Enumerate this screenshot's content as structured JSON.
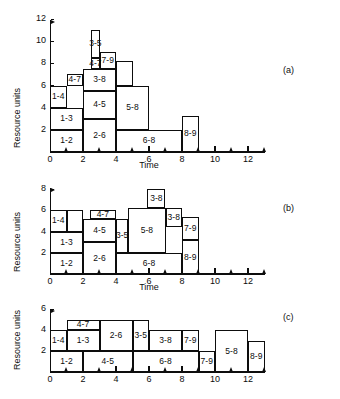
{
  "figure": {
    "caption_a": "(a)",
    "caption_b": "(b)",
    "caption_c": "(c)"
  },
  "axis_titles": {
    "y": "Resource units",
    "x": "Time"
  },
  "chart_data": [
    {
      "id": "a",
      "type": "bar",
      "title": "(a)",
      "xlabel": "Time",
      "ylabel": "Resource units",
      "xlim": [
        0,
        13
      ],
      "ylim": [
        0,
        12
      ],
      "xticks": [
        0,
        2,
        4,
        6,
        8,
        10,
        12
      ],
      "xtick_labels": [
        "0",
        "2",
        "4",
        "6",
        "8",
        "10",
        "12"
      ],
      "xminor_ticks": [
        1,
        3,
        5,
        7,
        9,
        11,
        13
      ],
      "yticks": [
        2,
        4,
        6,
        8,
        10,
        12
      ],
      "ytick_labels": [
        "2",
        "4",
        "6",
        "8",
        "10",
        "12"
      ],
      "grid": false,
      "legend": "none",
      "blocks": [
        {
          "label": "1-2",
          "x0": 0,
          "x1": 2,
          "y0": 0,
          "y1": 2
        },
        {
          "label": "1-3",
          "x0": 0,
          "x1": 2,
          "y0": 2,
          "y1": 4
        },
        {
          "label": "1-4",
          "x0": 0,
          "x1": 1,
          "y0": 4,
          "y1": 6
        },
        {
          "label": "4-7",
          "x0": 1,
          "x1": 2,
          "y0": 6,
          "y1": 7
        },
        {
          "label": "2-6",
          "x0": 2,
          "x1": 4,
          "y0": 0,
          "y1": 3
        },
        {
          "label": "4-5",
          "x0": 2,
          "x1": 4,
          "y0": 3,
          "y1": 5.5
        },
        {
          "label": "3-8",
          "x0": 2,
          "x1": 4,
          "y0": 5.5,
          "y1": 7.5
        },
        {
          "label": "4-7",
          "x0": 2.5,
          "x1": 3,
          "y0": 7.5,
          "y1": 8.5
        },
        {
          "label": "3-5",
          "x0": 2.5,
          "x1": 3,
          "y0": 8.5,
          "y1": 11
        },
        {
          "label": "7-9",
          "x0": 3,
          "x1": 4,
          "y0": 7.5,
          "y1": 9
        },
        {
          "label": "6-8",
          "x0": 4,
          "x1": 8,
          "y0": 0,
          "y1": 2
        },
        {
          "label": "5-8",
          "x0": 4,
          "x1": 6,
          "y0": 2,
          "y1": 6
        },
        {
          "label": "8-9",
          "x0": 8,
          "x1": 9,
          "y0": 0,
          "y1": 3.25
        },
        {
          "label": "",
          "x0": 4,
          "x1": 5,
          "y0": 6,
          "y1": 8.2
        }
      ]
    },
    {
      "id": "b",
      "type": "bar",
      "title": "(b)",
      "xlabel": "Time",
      "ylabel": "Resource units",
      "xlim": [
        0,
        13
      ],
      "ylim": [
        0,
        8
      ],
      "xticks": [
        0,
        2,
        4,
        6,
        8,
        10,
        12
      ],
      "xtick_labels": [
        "0",
        "2",
        "4",
        "6",
        "8",
        "10",
        "12"
      ],
      "xminor_ticks": [
        1,
        3,
        5,
        7,
        9,
        11,
        13
      ],
      "yticks": [
        2,
        4,
        6,
        8
      ],
      "ytick_labels": [
        "2",
        "4",
        "6",
        "8"
      ],
      "grid": false,
      "legend": "none",
      "blocks": [
        {
          "label": "1-2",
          "x0": 0,
          "x1": 2,
          "y0": 0,
          "y1": 2
        },
        {
          "label": "1-3",
          "x0": 0,
          "x1": 2,
          "y0": 2,
          "y1": 4
        },
        {
          "label": "1-4",
          "x0": 0,
          "x1": 1,
          "y0": 4,
          "y1": 6
        },
        {
          "label": "",
          "x0": 1,
          "x1": 2,
          "y0": 4,
          "y1": 6
        },
        {
          "label": "2-6",
          "x0": 2,
          "x1": 4,
          "y0": 0,
          "y1": 3
        },
        {
          "label": "4-5",
          "x0": 2,
          "x1": 4,
          "y0": 3,
          "y1": 5.2
        },
        {
          "label": "4-7",
          "x0": 2.4,
          "x1": 4,
          "y0": 5.2,
          "y1": 6
        },
        {
          "label": "3-5",
          "x0": 4,
          "x1": 4.75,
          "y0": 2,
          "y1": 5.2
        },
        {
          "label": "6-8",
          "x0": 4,
          "x1": 8,
          "y0": 0,
          "y1": 2
        },
        {
          "label": "5-8",
          "x0": 4.75,
          "x1": 7,
          "y0": 2,
          "y1": 6.2
        },
        {
          "label": "3-8",
          "x0": 5.9,
          "x1": 7,
          "y0": 6.2,
          "y1": 8
        },
        {
          "label": "3-8",
          "x0": 7,
          "x1": 8,
          "y0": 4.4,
          "y1": 6.2
        },
        {
          "label": "7-9",
          "x0": 8,
          "x1": 9,
          "y0": 3.2,
          "y1": 5.4
        },
        {
          "label": "8-9",
          "x0": 8,
          "x1": 9,
          "y0": 0,
          "y1": 3.2
        }
      ]
    },
    {
      "id": "c",
      "type": "bar",
      "title": "(c)",
      "xlabel": "Time",
      "ylabel": "Resource units",
      "xlim": [
        0,
        13
      ],
      "ylim": [
        0,
        6
      ],
      "xticks": [
        0,
        2,
        4,
        6,
        8,
        10,
        12
      ],
      "xtick_labels": [
        "0",
        "2",
        "4",
        "6",
        "8",
        "10",
        "12"
      ],
      "xminor_ticks": [
        1,
        3,
        5,
        7,
        9,
        11,
        13
      ],
      "yticks": [
        2,
        4,
        6
      ],
      "ytick_labels": [
        "2",
        "4",
        "6"
      ],
      "grid": false,
      "legend": "none",
      "blocks": [
        {
          "label": "1-2",
          "x0": 0,
          "x1": 2,
          "y0": 0,
          "y1": 2
        },
        {
          "label": "1-4",
          "x0": 0,
          "x1": 1,
          "y0": 2,
          "y1": 4
        },
        {
          "label": "1-3",
          "x0": 1,
          "x1": 3,
          "y0": 2,
          "y1": 4
        },
        {
          "label": "4-7",
          "x0": 1,
          "x1": 3,
          "y0": 4,
          "y1": 5
        },
        {
          "label": "4-5",
          "x0": 2,
          "x1": 5,
          "y0": 0,
          "y1": 2
        },
        {
          "label": "2-6",
          "x0": 3,
          "x1": 5,
          "y0": 2,
          "y1": 5
        },
        {
          "label": "3-5",
          "x0": 5,
          "x1": 6,
          "y0": 2,
          "y1": 5
        },
        {
          "label": "6-8",
          "x0": 5,
          "x1": 9,
          "y0": 0,
          "y1": 2
        },
        {
          "label": "3-8",
          "x0": 6,
          "x1": 8,
          "y0": 2,
          "y1": 4
        },
        {
          "label": "7-9",
          "x0": 8,
          "x1": 9,
          "y0": 2,
          "y1": 4
        },
        {
          "label": "7-9",
          "x0": 9,
          "x1": 10,
          "y0": 0,
          "y1": 2
        },
        {
          "label": "5-8",
          "x0": 10,
          "x1": 12,
          "y0": 0,
          "y1": 4
        },
        {
          "label": "8-9",
          "x0": 12,
          "x1": 13,
          "y0": 0,
          "y1": 3
        }
      ]
    }
  ]
}
